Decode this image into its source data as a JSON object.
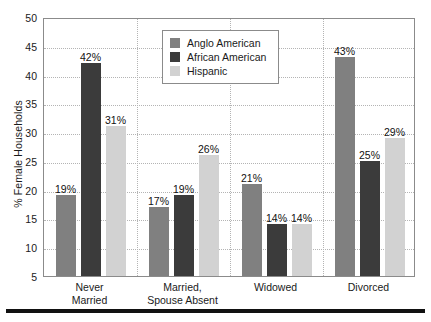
{
  "chart_data": {
    "type": "bar",
    "title": "",
    "xlabel": "",
    "ylabel": "% Female Households",
    "ylim": [
      5,
      50
    ],
    "yticks": [
      50,
      45,
      40,
      35,
      30,
      25,
      20,
      15,
      10,
      5
    ],
    "grid": true,
    "legend_position": "top-center",
    "categories": [
      "Never\nMarried",
      "Married,\nSpouse Absent",
      "Widowed",
      "Divorced"
    ],
    "category_lines": [
      [
        "Never",
        "Married"
      ],
      [
        "Married,",
        "Spouse Absent"
      ],
      [
        "Widowed",
        ""
      ],
      [
        "Divorced",
        ""
      ]
    ],
    "series": [
      {
        "name": "Anglo American",
        "color": "#808080",
        "values": [
          19,
          17,
          21,
          43
        ],
        "labels": [
          "19%",
          "17%",
          "21%",
          "43%"
        ]
      },
      {
        "name": "African American",
        "color": "#3b3b3b",
        "values": [
          42,
          19,
          14,
          25
        ],
        "labels": [
          "42%",
          "19%",
          "14%",
          "25%"
        ]
      },
      {
        "name": "Hispanic",
        "color": "#d2d2d2",
        "values": [
          31,
          26,
          14,
          29
        ],
        "labels": [
          "31%",
          "26%",
          "14%",
          "29%"
        ]
      }
    ]
  },
  "colors": {
    "anglo_american": "#808080",
    "african_american": "#3b3b3b",
    "hispanic": "#d2d2d2",
    "frame": "#8b8b8b",
    "gridline": "#b4b4b4",
    "text": "#1a1a1a",
    "rule": "#111111"
  }
}
